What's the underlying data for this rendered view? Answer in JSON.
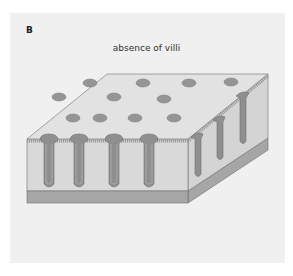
{
  "panel": {
    "label": "B",
    "title": "absence of villi"
  },
  "diagram": {
    "colors": {
      "background": "#f0f0f0",
      "top_surface": "#e2e2e2",
      "front_face": "#d9d9d9",
      "side_face": "#d4d4d4",
      "base_band": "#a6a6a6",
      "crypt_fill": "#8f8f8f",
      "crypt_epithelium": "#b0b0b0",
      "outline": "#6e6e6e"
    },
    "top_openings": [
      {
        "cx": 90,
        "cy": 83
      },
      {
        "cx": 143,
        "cy": 83
      },
      {
        "cx": 189,
        "cy": 83
      },
      {
        "cx": 59,
        "cy": 97
      },
      {
        "cx": 114,
        "cy": 97
      },
      {
        "cx": 164,
        "cy": 99
      },
      {
        "cx": 73,
        "cy": 118
      },
      {
        "cx": 100,
        "cy": 118
      },
      {
        "cx": 135,
        "cy": 118
      },
      {
        "cx": 174,
        "cy": 118
      },
      {
        "cx": 231,
        "cy": 82
      }
    ],
    "front_crypts": [
      {
        "x": 49
      },
      {
        "x": 79
      },
      {
        "x": 114
      },
      {
        "x": 149
      }
    ],
    "side_crypts": [
      {
        "x": 198,
        "top": 136,
        "bottom": 176
      },
      {
        "x": 220,
        "top": 121,
        "bottom": 159
      },
      {
        "x": 243,
        "top": 96,
        "bottom": 142
      }
    ]
  }
}
